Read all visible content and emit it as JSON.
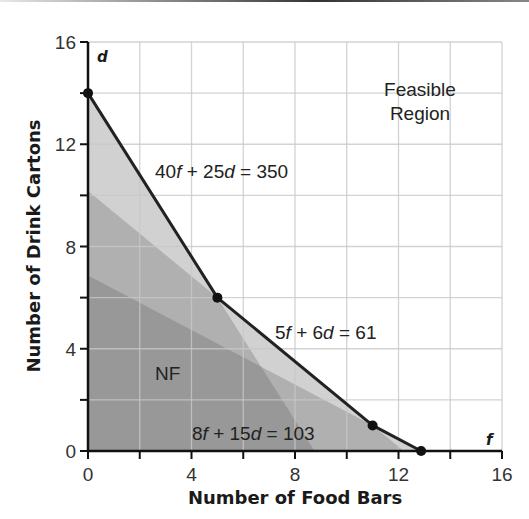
{
  "chart_data": {
    "type": "area",
    "title": "",
    "xlabel": "Number of Food Bars",
    "ylabel": "Number of Drink Cartons",
    "x_var": "f",
    "y_var": "d",
    "xlim": [
      0,
      16
    ],
    "ylim": [
      0,
      16
    ],
    "x_ticks": [
      0,
      4,
      8,
      12,
      16
    ],
    "y_ticks": [
      0,
      4,
      8,
      12,
      16
    ],
    "grid": true,
    "grid_step": 2,
    "constraints": [
      {
        "label": "40f + 25d = 350",
        "a": 40,
        "b": 25,
        "c": 350,
        "f_intercept": 8.75,
        "d_intercept": 14
      },
      {
        "label": "5f + 6d = 61",
        "a": 5,
        "b": 6,
        "c": 61,
        "f_intercept": 12.2,
        "d_intercept": 10.17
      },
      {
        "label": "8f + 15d = 103",
        "a": 8,
        "b": 15,
        "c": 103,
        "f_intercept": 12.875,
        "d_intercept": 6.87
      }
    ],
    "boundary_vertices": [
      [
        0,
        14
      ],
      [
        5,
        6
      ],
      [
        11,
        1
      ],
      [
        12.875,
        0
      ]
    ],
    "annotations": [
      {
        "text": "Feasible Region",
        "lines": [
          "Feasible",
          "Region"
        ]
      },
      {
        "text": "NF"
      }
    ]
  },
  "labels": {
    "x_ticks": [
      "0",
      "4",
      "8",
      "12",
      "16"
    ],
    "y_ticks": [
      "0",
      "4",
      "8",
      "12",
      "16"
    ],
    "xlabel": "Number of Food Bars",
    "ylabel": "Number of Drink Cartons",
    "x_var": "f",
    "y_var": "d",
    "feasible_line1": "Feasible",
    "feasible_line2": "Region",
    "nf": "NF"
  },
  "colors": {
    "background": "#ffffff",
    "grid": "#c8c8c8",
    "axis": "#111111",
    "boundary": "#222222",
    "shade_light": "#b4b4b4",
    "shade_mid": "#9c9c9c",
    "shade_dark": "#8a8a8a"
  }
}
